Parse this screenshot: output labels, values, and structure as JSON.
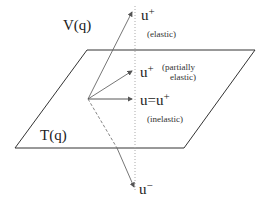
{
  "diagram": {
    "labels": {
      "velocity_space": "V(q)",
      "tangent_space": "T(q)",
      "u_plus_elastic_base": "u",
      "u_plus_elastic_sup": "+",
      "elastic_note": "(elastic)",
      "u_plus_partial_base": "u",
      "u_plus_partial_sup": "+",
      "partial_note_line1": "(partially",
      "partial_note_line2": "elastic)",
      "inelastic_base": "u=u",
      "inelastic_sup": "+",
      "inelastic_note": "(inelastic)",
      "u_minus_base": "u",
      "u_minus_sup": "−"
    },
    "colors": {
      "line": "#333333",
      "arrow": "#666666",
      "dotted": "#999999"
    }
  }
}
